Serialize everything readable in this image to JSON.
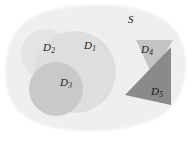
{
  "figure": {
    "type": "set-diagram",
    "width": 196,
    "height": 141,
    "background_color": "#ffffff"
  },
  "universe": {
    "name": "S",
    "label": "S",
    "label_x": 128,
    "label_y": 14,
    "fill_color": "#efefef",
    "shape": "rounded-blob"
  },
  "regions": [
    {
      "id": "D1",
      "label": "D",
      "subscript": "1",
      "shape": "circle",
      "cx": 75,
      "cy": 72,
      "r": 41,
      "fill_color": "#dedede",
      "label_x": 84,
      "label_y": 40
    },
    {
      "id": "D2",
      "label": "D",
      "subscript": "2",
      "shape": "circle",
      "cx": 46,
      "cy": 54,
      "r": 25,
      "fill_color": "#e4e4e4",
      "label_x": 43,
      "label_y": 42
    },
    {
      "id": "D3",
      "label": "D",
      "subscript": "3",
      "shape": "circle",
      "cx": 56,
      "cy": 89,
      "r": 27,
      "fill_color": "#c9c9c9",
      "label_x": 60,
      "label_y": 77
    },
    {
      "id": "D4",
      "label": "D",
      "subscript": "4",
      "shape": "triangle-down",
      "points": "136,40 173,40 152,75",
      "fill_color": "#c4c4c4",
      "label_x": 141,
      "label_y": 44
    },
    {
      "id": "D5",
      "label": "D",
      "subscript": "5",
      "shape": "triangle",
      "points": "171,47 171,105 125,95",
      "fill_color": "#8a8a8a",
      "label_x": 151,
      "label_y": 86
    }
  ],
  "colors": {
    "universe_fill": "#efefef",
    "d1_fill": "#dedede",
    "d2_fill": "#e4e4e4",
    "d3_fill": "#c9c9c9",
    "d4_fill": "#c4c4c4",
    "d5_fill": "#8a8a8a",
    "label_text": "#1b1b1b",
    "page_background": "#ffffff"
  }
}
